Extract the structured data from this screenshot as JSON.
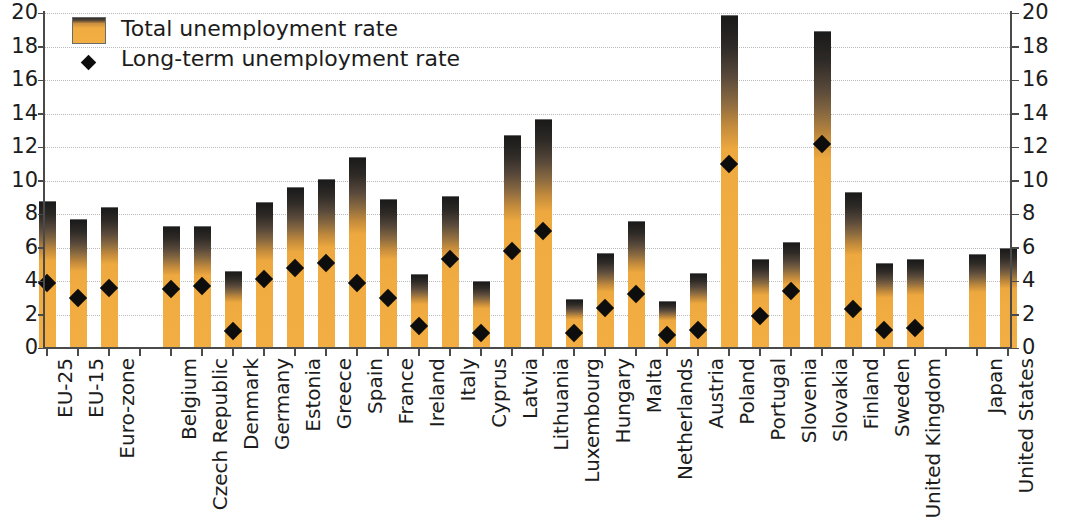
{
  "chart_data": {
    "type": "bar",
    "title": "",
    "xlabel": "",
    "ylabel": "",
    "ylim": [
      0,
      20
    ],
    "yticks": [
      0,
      2,
      4,
      6,
      8,
      10,
      12,
      14,
      16,
      18,
      20
    ],
    "grid": true,
    "legend_position": "top-left",
    "legend": [
      {
        "label": "Total unemployment rate",
        "marker": "bar-swatch",
        "color": "#f0ab41"
      },
      {
        "label": "Long-term unemployment rate",
        "marker": "diamond",
        "color": "#0d0d0d"
      }
    ],
    "categories": [
      "EU-25",
      "EU-15",
      "Euro-zone",
      "",
      "Belgium",
      "Czech Republic",
      "Denmark",
      "Germany",
      "Estonia",
      "Greece",
      "Spain",
      "France",
      "Ireland",
      "Italy",
      "Cyprus",
      "Latvia",
      "Lithuania",
      "Luxembourg",
      "Hungary",
      "Malta",
      "Netherlands",
      "Austria",
      "Poland",
      "Portugal",
      "Slovenia",
      "Slovakia",
      "Finland",
      "Sweden",
      "United Kingdom",
      "",
      "Japan",
      "United States"
    ],
    "series": [
      {
        "name": "Total unemployment rate",
        "type": "bar",
        "values": [
          8.8,
          7.7,
          8.4,
          null,
          7.3,
          7.3,
          4.6,
          8.7,
          9.6,
          10.1,
          11.4,
          8.9,
          4.4,
          9.1,
          4.0,
          12.7,
          13.7,
          2.9,
          5.7,
          7.6,
          2.8,
          4.5,
          19.9,
          5.3,
          6.3,
          18.9,
          9.3,
          5.1,
          5.3,
          null,
          5.6,
          6.0
        ]
      },
      {
        "name": "Long-term unemployment rate",
        "type": "scatter",
        "values": [
          3.9,
          3.0,
          3.6,
          null,
          3.5,
          3.7,
          1.0,
          4.1,
          4.8,
          5.1,
          3.9,
          3.0,
          1.3,
          5.3,
          0.9,
          5.8,
          7.0,
          0.9,
          2.4,
          3.2,
          0.8,
          1.1,
          11.0,
          1.9,
          3.4,
          12.2,
          2.3,
          1.1,
          1.2,
          null,
          null,
          null
        ]
      }
    ]
  },
  "axes": {
    "left_labels": [
      "20",
      "18",
      "16",
      "14",
      "12",
      "10",
      "8",
      "6",
      "4",
      "2",
      "0"
    ],
    "right_labels": [
      "20",
      "18",
      "16",
      "14",
      "12",
      "10",
      "8",
      "6",
      "4",
      "2",
      "0"
    ]
  },
  "colors": {
    "bar_bottom": "#f2ad43",
    "bar_top": "#1a1a1a",
    "marker": "#0d0d0d",
    "grid": "#b9b9b9",
    "axis": "#4a4a4a",
    "text": "#1c1c1c"
  }
}
